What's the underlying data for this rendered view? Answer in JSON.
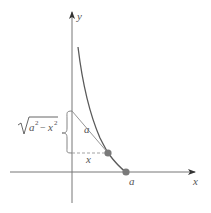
{
  "figure": {
    "type": "tractrix-geometry",
    "colors": {
      "axis": "#777777",
      "curve": "#5a5a5a",
      "tangent": "#8a8a8a",
      "dashed": "#999999",
      "point": "#7a7a7a",
      "text": "#555555"
    },
    "axes": {
      "x_label": "x",
      "y_label": "y"
    },
    "labels": {
      "tangent_length": "a",
      "horizontal_segment": "x",
      "x_intercept": "a",
      "vertical_segment_radicand_a": "a",
      "vertical_segment_radicand_x": "x",
      "vertical_segment_exp": "2",
      "vertical_segment_minus": "−",
      "vertical_segment_full": "√(a² − x²)"
    },
    "points": [
      {
        "name": "curve-point",
        "x_px": 108,
        "y_px": 153
      },
      {
        "name": "x-intercept-point",
        "x_px": 126,
        "y_px": 172
      }
    ]
  }
}
